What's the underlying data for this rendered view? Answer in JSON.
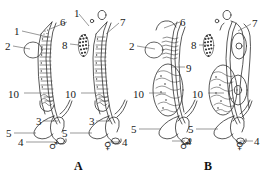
{
  "figure": {
    "type": "scientific-line-diagram",
    "background_color": "#ffffff",
    "ink_color": "#2b2b2b",
    "panels": [
      {
        "id": "A",
        "label": "A",
        "label_pos": [
          74,
          160
        ],
        "specimens": [
          {
            "sex_symbol": "♂",
            "sex": "male",
            "sym_pos": [
              49,
              141
            ]
          },
          {
            "sex_symbol": "♀",
            "sex": "female",
            "sym_pos": [
              104,
              141
            ]
          }
        ]
      },
      {
        "id": "B",
        "label": "B",
        "label_pos": [
          204,
          160
        ],
        "specimens": [
          {
            "sex_symbol": "♂",
            "sex": "male",
            "sym_pos": [
              180,
              141
            ]
          },
          {
            "sex_symbol": "♀",
            "sex": "female",
            "sym_pos": [
              236,
              141
            ]
          }
        ]
      }
    ],
    "callouts": [
      {
        "id": "c1",
        "text": "1",
        "x": 14,
        "y": 26,
        "line": [
          [
            22,
            31
          ],
          [
            48,
            37
          ]
        ]
      },
      {
        "id": "c2",
        "text": "2",
        "x": 5,
        "y": 41,
        "line": [
          [
            13,
            46
          ],
          [
            30,
            49
          ]
        ]
      },
      {
        "id": "c3",
        "text": "6",
        "x": 60,
        "y": 17,
        "line": [
          [
            67,
            22
          ],
          [
            50,
            29
          ]
        ]
      },
      {
        "id": "c4",
        "text": "1",
        "x": 74,
        "y": 8,
        "line": [
          [
            79,
            14
          ],
          [
            89,
            26
          ]
        ]
      },
      {
        "id": "c5",
        "text": "8",
        "x": 62,
        "y": 40,
        "line": [
          [
            70,
            44
          ],
          [
            79,
            45
          ]
        ]
      },
      {
        "id": "c6",
        "text": "7",
        "x": 120,
        "y": 17,
        "line": [
          [
            119,
            23
          ],
          [
            106,
            34
          ]
        ]
      },
      {
        "id": "c7",
        "text": "10",
        "x": 8,
        "y": 89,
        "line": [
          [
            24,
            93
          ],
          [
            42,
            93
          ]
        ]
      },
      {
        "id": "c8",
        "text": "10",
        "x": 65,
        "y": 89,
        "line": [
          [
            81,
            93
          ],
          [
            97,
            93
          ]
        ]
      },
      {
        "id": "c9",
        "text": "3",
        "x": 36,
        "y": 116,
        "line": [
          [
            43,
            121
          ],
          [
            58,
            121
          ]
        ]
      },
      {
        "id": "c10",
        "text": "5",
        "x": 6,
        "y": 128,
        "line": [
          [
            14,
            133
          ],
          [
            36,
            133
          ]
        ]
      },
      {
        "id": "c11",
        "text": "4",
        "x": 18,
        "y": 137,
        "line": [
          [
            26,
            142
          ],
          [
            55,
            142
          ]
        ]
      },
      {
        "id": "c12",
        "text": "3",
        "x": 89,
        "y": 116,
        "line": [
          [
            96,
            121
          ],
          [
            110,
            121
          ]
        ]
      },
      {
        "id": "c13",
        "text": "5",
        "x": 62,
        "y": 128,
        "line": [
          [
            70,
            133
          ],
          [
            92,
            133
          ]
        ]
      },
      {
        "id": "c14",
        "text": "4",
        "x": 122,
        "y": 137,
        "line": [
          [
            121,
            142
          ],
          [
            108,
            142
          ]
        ]
      },
      {
        "id": "c15",
        "text": "2",
        "x": 129,
        "y": 41,
        "line": [
          [
            137,
            46
          ],
          [
            155,
            49
          ]
        ]
      },
      {
        "id": "c16",
        "text": "6",
        "x": 180,
        "y": 17,
        "line": [
          [
            180,
            22
          ],
          [
            164,
            28
          ]
        ]
      },
      {
        "id": "c17",
        "text": "8",
        "x": 191,
        "y": 40,
        "line": [
          [
            199,
            45
          ],
          [
            207,
            45
          ]
        ]
      },
      {
        "id": "c18",
        "text": "7",
        "x": 252,
        "y": 18,
        "line": [
          [
            251,
            24
          ],
          [
            238,
            31
          ]
        ]
      },
      {
        "id": "c19",
        "text": "9",
        "x": 186,
        "y": 63,
        "line": [
          [
            185,
            67
          ],
          [
            172,
            67
          ]
        ]
      },
      {
        "id": "c20",
        "text": "10",
        "x": 133,
        "y": 89,
        "line": [
          [
            149,
            93
          ],
          [
            166,
            93
          ]
        ]
      },
      {
        "id": "c21",
        "text": "10",
        "x": 192,
        "y": 89,
        "line": [
          [
            208,
            93
          ],
          [
            224,
            93
          ]
        ]
      },
      {
        "id": "c22",
        "text": "5",
        "x": 131,
        "y": 124,
        "line": [
          [
            139,
            129
          ],
          [
            161,
            129
          ]
        ]
      },
      {
        "id": "c23",
        "text": "4",
        "x": 186,
        "y": 136,
        "line": [
          [
            185,
            141
          ],
          [
            172,
            141
          ]
        ]
      },
      {
        "id": "c24",
        "text": "5",
        "x": 188,
        "y": 124,
        "line": [
          [
            196,
            129
          ],
          [
            218,
            129
          ]
        ]
      },
      {
        "id": "c25",
        "text": "4",
        "x": 254,
        "y": 136,
        "line": [
          [
            253,
            141
          ],
          [
            240,
            141
          ]
        ]
      }
    ],
    "legend_numbers": [
      "1",
      "2",
      "3",
      "4",
      "5",
      "6",
      "7",
      "8",
      "9",
      "10"
    ]
  }
}
